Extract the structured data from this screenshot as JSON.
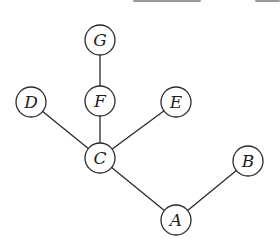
{
  "diagram": {
    "type": "tree",
    "nodes": [
      {
        "id": "G",
        "label": "G",
        "x": 100,
        "y": 40
      },
      {
        "id": "D",
        "label": "D",
        "x": 31,
        "y": 102
      },
      {
        "id": "F",
        "label": "F",
        "x": 100,
        "y": 101
      },
      {
        "id": "E",
        "label": "E",
        "x": 176,
        "y": 102
      },
      {
        "id": "C",
        "label": "C",
        "x": 100,
        "y": 158
      },
      {
        "id": "B",
        "label": "B",
        "x": 248,
        "y": 161
      },
      {
        "id": "A",
        "label": "A",
        "x": 176,
        "y": 220
      }
    ],
    "edges": [
      {
        "from": "G",
        "to": "F"
      },
      {
        "from": "F",
        "to": "C"
      },
      {
        "from": "D",
        "to": "C"
      },
      {
        "from": "E",
        "to": "C"
      },
      {
        "from": "C",
        "to": "A"
      },
      {
        "from": "B",
        "to": "A"
      }
    ],
    "node_radius": 15,
    "stroke_color": "#2a2a2a"
  }
}
